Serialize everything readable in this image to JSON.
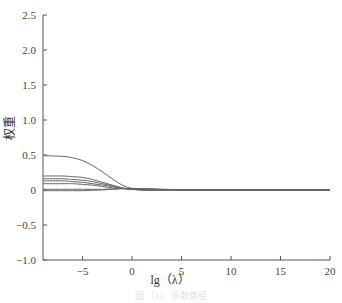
{
  "chart_data": {
    "type": "line",
    "title": "",
    "xlabel": "lg（λ）",
    "ylabel": "权重",
    "xlim": [
      -9,
      20
    ],
    "ylim": [
      -1.0,
      2.5
    ],
    "xticks": [
      -5,
      0,
      5,
      10,
      15,
      20
    ],
    "xtick_labels": [
      "−5",
      "0",
      "5",
      "10",
      "15",
      "20"
    ],
    "yticks": [
      2.5,
      2.0,
      1.5,
      1.0,
      0.5,
      0,
      -0.5,
      -1.0
    ],
    "ytick_labels": [
      "2.5",
      "2.0",
      "1.5",
      "1.0",
      "0.5",
      "0",
      "−0.5",
      "−1.0"
    ],
    "grid": false,
    "legend": null,
    "x": [
      -9,
      -7,
      -6,
      -5,
      -4,
      -3,
      -2,
      -1,
      0,
      1,
      2,
      3,
      5,
      7,
      10,
      15,
      20
    ],
    "series": [
      {
        "name": "coef1",
        "values": [
          0.49,
          0.48,
          0.46,
          0.42,
          0.35,
          0.26,
          0.16,
          0.07,
          0.02,
          0.01,
          0.005,
          0.003,
          0.001,
          0,
          0,
          0,
          0
        ]
      },
      {
        "name": "coef2",
        "values": [
          0.2,
          0.2,
          0.19,
          0.18,
          0.15,
          0.11,
          0.07,
          0.03,
          0.01,
          0.0,
          0.0,
          0.0,
          0,
          0,
          0,
          0,
          0
        ]
      },
      {
        "name": "coef3",
        "values": [
          0.16,
          0.16,
          0.15,
          0.14,
          0.12,
          0.09,
          0.06,
          0.03,
          0.01,
          0.0,
          0.0,
          0.0,
          0,
          0,
          0,
          0,
          0
        ]
      },
      {
        "name": "coef4",
        "values": [
          0.13,
          0.13,
          0.12,
          0.11,
          0.09,
          0.07,
          0.05,
          0.02,
          0.01,
          0.005,
          0.0,
          0.0,
          0,
          0,
          0,
          0,
          0
        ]
      },
      {
        "name": "coef5",
        "values": [
          0.09,
          0.09,
          0.09,
          0.08,
          0.07,
          0.05,
          0.03,
          0.02,
          0.01,
          0.005,
          0.0,
          0.0,
          0,
          0,
          0,
          0,
          0
        ]
      },
      {
        "name": "coef6",
        "values": [
          0.01,
          0.01,
          0.01,
          0.01,
          0.01,
          0.01,
          0.015,
          0.02,
          0.02,
          0.02,
          0.015,
          0.01,
          0.005,
          0,
          0,
          0,
          0
        ]
      },
      {
        "name": "coef7",
        "values": [
          -0.01,
          -0.01,
          -0.01,
          -0.01,
          -0.005,
          0.0,
          0.01,
          0.02,
          0.025,
          0.02,
          0.015,
          0.01,
          0.003,
          0,
          0,
          0,
          0
        ]
      }
    ]
  },
  "caption": "图 （λ） 系数路径"
}
